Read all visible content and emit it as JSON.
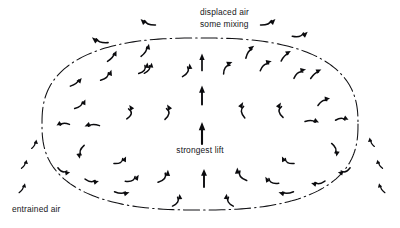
{
  "figure": {
    "title_visible": false,
    "background_color": "#ffffff",
    "ink_color": "#0b0b0e",
    "width": 400,
    "height": 228
  },
  "labels": {
    "top_line1": "displaced air",
    "top_line2": "some mixing",
    "center": "strongest lift",
    "bottom_left": "entrained air"
  },
  "boundary": {
    "name": "thermal-bubble-outline",
    "style": "dash-dot",
    "dash_pattern": "16 4 1.5 4",
    "stroke_color": "#111114",
    "center_x": 200,
    "center_y": 124,
    "radius_x": 158,
    "radius_y": 86
  },
  "chart_data": {
    "type": "scatter",
    "xlabel": "",
    "ylabel": "",
    "annotations": [
      {
        "text": "displaced air",
        "x": 240,
        "y": 14
      },
      {
        "text": "some mixing",
        "x": 240,
        "y": 26
      },
      {
        "text": "strongest lift",
        "x": 200,
        "y": 150
      },
      {
        "text": "entrained air",
        "x": 45,
        "y": 210
      }
    ],
    "vectors": [
      {
        "x": 202,
        "y": 62,
        "angle": -90,
        "len": 17,
        "curve": 0,
        "w": 1.7,
        "region": "core"
      },
      {
        "x": 202,
        "y": 95,
        "angle": -90,
        "len": 19,
        "curve": 0,
        "w": 1.9,
        "region": "core"
      },
      {
        "x": 202,
        "y": 133,
        "angle": -90,
        "len": 22,
        "curve": 0,
        "w": 2.1,
        "region": "core"
      },
      {
        "x": 204,
        "y": 178,
        "angle": -90,
        "len": 18,
        "curve": 0,
        "w": 1.9,
        "region": "core"
      },
      {
        "x": 186,
        "y": 70,
        "angle": -62,
        "len": 15,
        "curve": 14,
        "w": 1.5,
        "region": "inner-left"
      },
      {
        "x": 166,
        "y": 112,
        "angle": -82,
        "len": 15,
        "curve": 18,
        "w": 1.5,
        "region": "inner-left"
      },
      {
        "x": 128,
        "y": 112,
        "angle": -80,
        "len": 14,
        "curve": 20,
        "w": 1.5,
        "region": "inner-left"
      },
      {
        "x": 143,
        "y": 68,
        "angle": -52,
        "len": 14,
        "curve": 14,
        "w": 1.5,
        "region": "inner-left"
      },
      {
        "x": 106,
        "y": 75,
        "angle": -44,
        "len": 15,
        "curve": 12,
        "w": 1.5,
        "region": "inner-left"
      },
      {
        "x": 80,
        "y": 104,
        "angle": -40,
        "len": 14,
        "curve": 10,
        "w": 1.5,
        "region": "inner-left"
      },
      {
        "x": 63,
        "y": 125,
        "angle": 175,
        "len": 13,
        "curve": 10,
        "w": 1.5,
        "region": "inner-left"
      },
      {
        "x": 92,
        "y": 126,
        "angle": 177,
        "len": 15,
        "curve": 8,
        "w": 1.5,
        "region": "inner-left"
      },
      {
        "x": 82,
        "y": 152,
        "angle": 108,
        "len": 14,
        "curve": 12,
        "w": 1.5,
        "region": "inner-left"
      },
      {
        "x": 64,
        "y": 170,
        "angle": 20,
        "len": 13,
        "curve": 12,
        "w": 1.5,
        "region": "inner-left"
      },
      {
        "x": 92,
        "y": 180,
        "angle": 8,
        "len": 14,
        "curve": 10,
        "w": 1.5,
        "region": "inner-left"
      },
      {
        "x": 122,
        "y": 192,
        "angle": 2,
        "len": 15,
        "curve": 8,
        "w": 1.5,
        "region": "inner-left"
      },
      {
        "x": 120,
        "y": 160,
        "angle": -30,
        "len": 14,
        "curve": 14,
        "w": 1.5,
        "region": "inner-left"
      },
      {
        "x": 132,
        "y": 178,
        "angle": -26,
        "len": 15,
        "curve": 14,
        "w": 1.5,
        "region": "inner-left"
      },
      {
        "x": 163,
        "y": 176,
        "angle": -52,
        "len": 16,
        "curve": 16,
        "w": 1.6,
        "region": "inner-left"
      },
      {
        "x": 176,
        "y": 200,
        "angle": -60,
        "len": 14,
        "curve": 14,
        "w": 1.5,
        "region": "inner-left"
      },
      {
        "x": 148,
        "y": 68,
        "angle": -55,
        "len": 13,
        "curve": 10,
        "w": 1.4,
        "region": "inner-left"
      },
      {
        "x": 228,
        "y": 68,
        "angle": -54,
        "len": 15,
        "curve": -14,
        "w": 1.5,
        "region": "inner-right"
      },
      {
        "x": 244,
        "y": 110,
        "angle": -96,
        "len": 16,
        "curve": -16,
        "w": 1.5,
        "region": "inner-right"
      },
      {
        "x": 282,
        "y": 110,
        "angle": -98,
        "len": 15,
        "curve": -18,
        "w": 1.5,
        "region": "inner-right"
      },
      {
        "x": 266,
        "y": 66,
        "angle": -40,
        "len": 15,
        "curve": -12,
        "w": 1.5,
        "region": "inner-right"
      },
      {
        "x": 300,
        "y": 74,
        "angle": -36,
        "len": 15,
        "curve": -12,
        "w": 1.5,
        "region": "inner-right"
      },
      {
        "x": 324,
        "y": 102,
        "angle": -30,
        "len": 14,
        "curve": -10,
        "w": 1.5,
        "region": "inner-right"
      },
      {
        "x": 342,
        "y": 120,
        "angle": -2,
        "len": 13,
        "curve": -10,
        "w": 1.5,
        "region": "inner-right"
      },
      {
        "x": 312,
        "y": 122,
        "angle": 4,
        "len": 14,
        "curve": -8,
        "w": 1.5,
        "region": "inner-right"
      },
      {
        "x": 334,
        "y": 150,
        "angle": 70,
        "len": 14,
        "curve": -12,
        "w": 1.5,
        "region": "inner-right"
      },
      {
        "x": 344,
        "y": 170,
        "angle": 160,
        "len": 13,
        "curve": -12,
        "w": 1.5,
        "region": "inner-right"
      },
      {
        "x": 318,
        "y": 182,
        "angle": 172,
        "len": 14,
        "curve": -10,
        "w": 1.5,
        "region": "inner-right"
      },
      {
        "x": 286,
        "y": 192,
        "angle": 178,
        "len": 15,
        "curve": -8,
        "w": 1.5,
        "region": "inner-right"
      },
      {
        "x": 288,
        "y": 160,
        "angle": -150,
        "len": 14,
        "curve": -14,
        "w": 1.5,
        "region": "inner-right"
      },
      {
        "x": 272,
        "y": 180,
        "angle": -154,
        "len": 15,
        "curve": -14,
        "w": 1.5,
        "region": "inner-right"
      },
      {
        "x": 242,
        "y": 174,
        "angle": -126,
        "len": 16,
        "curve": -16,
        "w": 1.6,
        "region": "inner-right"
      },
      {
        "x": 230,
        "y": 200,
        "angle": -118,
        "len": 14,
        "curve": -14,
        "w": 1.5,
        "region": "inner-right"
      },
      {
        "x": 145,
        "y": 50,
        "angle": -58,
        "len": 15,
        "curve": 8,
        "w": 1.5,
        "region": "upper-rim-left"
      },
      {
        "x": 112,
        "y": 56,
        "angle": -50,
        "len": 14,
        "curve": 6,
        "w": 1.5,
        "region": "upper-rim-left"
      },
      {
        "x": 250,
        "y": 52,
        "angle": -56,
        "len": 15,
        "curve": -8,
        "w": 1.5,
        "region": "upper-rim-right"
      },
      {
        "x": 286,
        "y": 56,
        "angle": -46,
        "len": 14,
        "curve": -6,
        "w": 1.5,
        "region": "upper-rim-right"
      },
      {
        "x": 316,
        "y": 74,
        "angle": -40,
        "len": 14,
        "curve": -6,
        "w": 1.5,
        "region": "upper-rim-right"
      },
      {
        "x": 76,
        "y": 82,
        "angle": -36,
        "len": 14,
        "curve": 6,
        "w": 1.5,
        "region": "upper-rim-left"
      },
      {
        "x": 148,
        "y": 22,
        "angle": -158,
        "len": 16,
        "curve": -10,
        "w": 1.6,
        "region": "exterior-top"
      },
      {
        "x": 100,
        "y": 40,
        "angle": -162,
        "len": 17,
        "curve": -10,
        "w": 1.6,
        "region": "exterior-top"
      },
      {
        "x": 268,
        "y": 22,
        "angle": -22,
        "len": 16,
        "curve": 10,
        "w": 1.6,
        "region": "exterior-top"
      },
      {
        "x": 300,
        "y": 34,
        "angle": -16,
        "len": 16,
        "curve": 12,
        "w": 1.6,
        "region": "exterior-top"
      },
      {
        "x": 34,
        "y": 144,
        "angle": -62,
        "len": 10,
        "curve": 6,
        "w": 1.3,
        "region": "entrained-left"
      },
      {
        "x": 24,
        "y": 164,
        "angle": -60,
        "len": 10,
        "curve": 6,
        "w": 1.3,
        "region": "entrained-left"
      },
      {
        "x": 22,
        "y": 188,
        "angle": -58,
        "len": 11,
        "curve": 6,
        "w": 1.3,
        "region": "entrained-left"
      },
      {
        "x": 372,
        "y": 142,
        "angle": -118,
        "len": 10,
        "curve": -6,
        "w": 1.3,
        "region": "entrained-right"
      },
      {
        "x": 380,
        "y": 164,
        "angle": -120,
        "len": 10,
        "curve": -6,
        "w": 1.3,
        "region": "entrained-right"
      },
      {
        "x": 382,
        "y": 188,
        "angle": -122,
        "len": 11,
        "curve": -6,
        "w": 1.3,
        "region": "entrained-right"
      }
    ]
  }
}
